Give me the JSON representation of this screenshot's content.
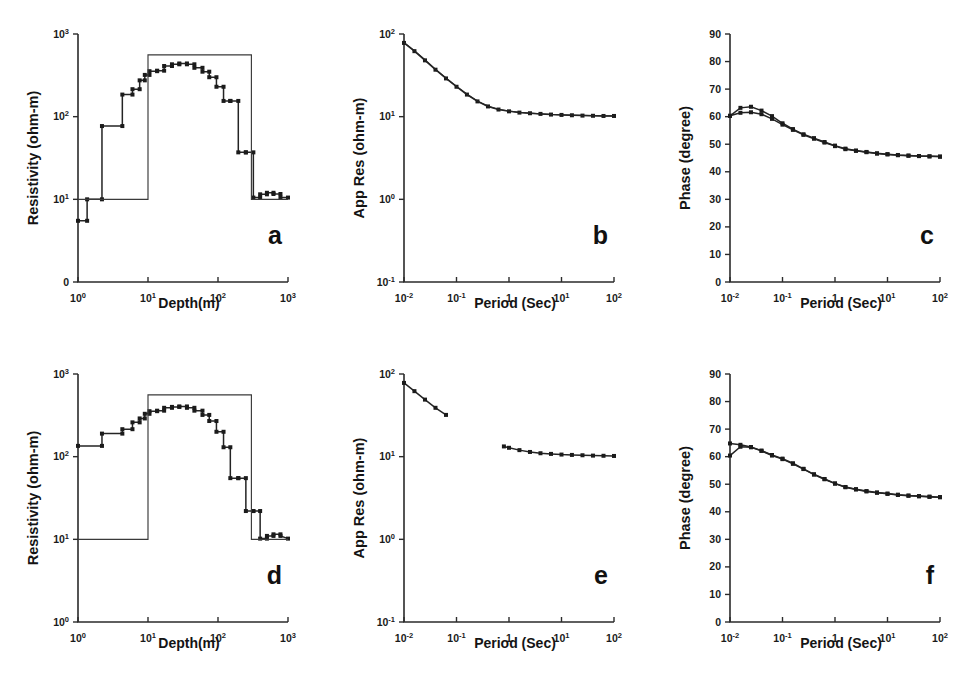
{
  "figure": {
    "background": "#ffffff",
    "ink_color": "#1a1a1a",
    "panel_count": 6
  },
  "chart_data": [
    {
      "id": "a",
      "type": "line",
      "panel_letter": "a",
      "title": "",
      "xlabel": "Depth(m)",
      "ylabel": "Resistivity (ohm-m)",
      "xscale": "log",
      "yscale": "log",
      "xlim": [
        1,
        1000
      ],
      "ylim": [
        1,
        1000
      ],
      "xticks": [
        1,
        10,
        100,
        1000
      ],
      "xticklabels": [
        "10⁰",
        "10¹",
        "10²",
        "10³"
      ],
      "yticks": [
        1,
        10,
        100,
        1000
      ],
      "yticklabels": [
        "0",
        "10¹",
        "10²",
        "10³"
      ],
      "grid": false,
      "legend": "none",
      "series": [
        {
          "name": "inverted-model-staircase",
          "style": "step-with-square-markers",
          "x": [
            1.0,
            1.35,
            1.35,
            2.2,
            2.2,
            4.3,
            4.3,
            6.0,
            6.0,
            7.6,
            7.6,
            9.0,
            9.0,
            10.5,
            10.5,
            13.5,
            13.5,
            17.0,
            17.0,
            22.0,
            22.0,
            28.0,
            28.0,
            36.0,
            36.0,
            46.0,
            46.0,
            60.0,
            60.0,
            75.0,
            75.0,
            95.0,
            95.0,
            120.0,
            120.0,
            150.0,
            150.0,
            195.0,
            195.0,
            250.0,
            250.0,
            320.0,
            320.0,
            400.0,
            400.0,
            500.0,
            500.0,
            620.0,
            620.0,
            780.0,
            780.0,
            1000.0
          ],
          "y": [
            5.5,
            5.5,
            10.0,
            10.0,
            77.0,
            77.0,
            185.0,
            185.0,
            215.0,
            215.0,
            275.0,
            275.0,
            320.0,
            320.0,
            355.0,
            355.0,
            360.0,
            360.0,
            410.0,
            410.0,
            430.0,
            430.0,
            440.0,
            440.0,
            430.0,
            430.0,
            390.0,
            390.0,
            350.0,
            350.0,
            300.0,
            300.0,
            230.0,
            230.0,
            155.0,
            155.0,
            155.0,
            155.0,
            37.0,
            37.0,
            37.0,
            37.0,
            10.5,
            10.5,
            11.5,
            11.5,
            12.0,
            12.0,
            11.6,
            11.6,
            10.5,
            10.5
          ]
        },
        {
          "name": "true-layered-model",
          "style": "block-step",
          "x": [
            1.0,
            10.0,
            10.0,
            300.0,
            300.0,
            1000.0
          ],
          "y": [
            10.0,
            10.0,
            560.0,
            560.0,
            10.0,
            10.0
          ]
        }
      ]
    },
    {
      "id": "b",
      "type": "line",
      "panel_letter": "b",
      "title": "",
      "xlabel": "Period (Sec)",
      "ylabel": "App Res (ohm-m)",
      "xscale": "log",
      "yscale": "log",
      "xlim": [
        0.01,
        100
      ],
      "ylim": [
        0.1,
        100
      ],
      "xticks": [
        0.01,
        0.1,
        1,
        10,
        100
      ],
      "xticklabels": [
        "10⁻²",
        "10⁻¹",
        "1",
        "10¹",
        "10²"
      ],
      "yticks": [
        0.1,
        1,
        10,
        100
      ],
      "yticklabels": [
        "10⁻¹",
        "10⁰",
        "10¹",
        "10²"
      ],
      "grid": false,
      "legend": "none",
      "series": [
        {
          "name": "apparent-resistivity-observed",
          "style": "line-with-square-markers",
          "x": [
            0.01,
            0.0158,
            0.0251,
            0.0398,
            0.0631,
            0.1,
            0.158,
            0.251,
            0.398,
            0.631,
            1.0,
            1.58,
            2.51,
            3.98,
            6.31,
            10.0,
            15.8,
            25.1,
            39.8,
            63.1,
            100.0
          ],
          "y": [
            78.0,
            62.0,
            48.0,
            37.0,
            29.0,
            23.0,
            18.5,
            15.3,
            13.3,
            12.2,
            11.6,
            11.2,
            11.0,
            10.8,
            10.6,
            10.5,
            10.4,
            10.3,
            10.25,
            10.2,
            10.2
          ]
        },
        {
          "name": "apparent-resistivity-calculated",
          "style": "line-overlay",
          "x": [
            0.01,
            0.0158,
            0.0251,
            0.0398,
            0.0631,
            0.1,
            0.158,
            0.251,
            0.398,
            0.631,
            1.0,
            1.58,
            2.51,
            3.98,
            6.31,
            10.0,
            15.8,
            25.1,
            39.8,
            63.1,
            100.0
          ],
          "y": [
            79.0,
            63.0,
            48.8,
            37.6,
            29.4,
            23.3,
            18.8,
            15.5,
            13.4,
            12.3,
            11.7,
            11.3,
            11.05,
            10.85,
            10.65,
            10.55,
            10.45,
            10.35,
            10.3,
            10.25,
            10.25
          ]
        }
      ]
    },
    {
      "id": "c",
      "type": "line",
      "panel_letter": "c",
      "title": "",
      "xlabel": "Period (Sec)",
      "ylabel": "Phase (degree)",
      "xscale": "log",
      "yscale": "linear",
      "xlim": [
        0.01,
        100
      ],
      "ylim": [
        0,
        90
      ],
      "xticks": [
        0.01,
        0.1,
        1,
        10,
        100
      ],
      "xticklabels": [
        "10⁻²",
        "10⁻¹",
        "1",
        "10¹",
        "10²"
      ],
      "yticks": [
        0,
        10,
        20,
        30,
        40,
        50,
        60,
        70,
        80,
        90
      ],
      "yticklabels": [
        "0",
        "10",
        "20",
        "30",
        "40",
        "50",
        "60",
        "70",
        "80",
        "90"
      ],
      "grid": false,
      "legend": "none",
      "series": [
        {
          "name": "phase-curve-upper",
          "style": "line-with-square-markers",
          "x": [
            0.01,
            0.0158,
            0.0251,
            0.0398,
            0.0631,
            0.1,
            0.158,
            0.251,
            0.398,
            0.631,
            1.0,
            1.58,
            2.51,
            3.98,
            6.31,
            10.0,
            15.8,
            25.1,
            39.8,
            63.1,
            100.0
          ],
          "y": [
            60.3,
            63.2,
            63.6,
            62.2,
            60.2,
            57.6,
            55.5,
            53.6,
            52.2,
            50.8,
            49.5,
            48.4,
            47.7,
            47.2,
            46.7,
            46.4,
            46.1,
            45.9,
            45.7,
            45.6,
            45.5
          ]
        },
        {
          "name": "phase-curve-lower",
          "style": "line-with-square-markers",
          "x": [
            0.01,
            0.0158,
            0.0251,
            0.0398,
            0.0631,
            0.1,
            0.158,
            0.251,
            0.398,
            0.631,
            1.0,
            1.58,
            2.51,
            3.98,
            6.31,
            10.0,
            15.8,
            25.1,
            39.8,
            63.1,
            100.0
          ],
          "y": [
            60.3,
            61.4,
            61.6,
            60.9,
            59.2,
            57.1,
            55.2,
            53.4,
            52.0,
            50.6,
            49.3,
            48.2,
            47.6,
            47.1,
            46.6,
            46.3,
            46.0,
            45.8,
            45.7,
            45.6,
            45.5
          ]
        }
      ]
    },
    {
      "id": "d",
      "type": "line",
      "panel_letter": "d",
      "title": "",
      "xlabel": "Depth(m)",
      "ylabel": "Resistivity (ohm-m)",
      "xscale": "log",
      "yscale": "log",
      "xlim": [
        1,
        1000
      ],
      "ylim": [
        1,
        1000
      ],
      "xticks": [
        1,
        10,
        100,
        1000
      ],
      "xticklabels": [
        "10⁰",
        "10¹",
        "10²",
        "10³"
      ],
      "yticks": [
        1,
        10,
        100,
        1000
      ],
      "yticklabels": [
        "10⁰",
        "10¹",
        "10²",
        "10³"
      ],
      "grid": false,
      "legend": "none",
      "series": [
        {
          "name": "inverted-model-staircase",
          "style": "step-with-square-markers",
          "x": [
            1.0,
            2.2,
            2.2,
            4.3,
            4.3,
            6.0,
            6.0,
            7.6,
            7.6,
            9.0,
            9.0,
            10.5,
            10.5,
            13.5,
            13.5,
            17.0,
            17.0,
            22.0,
            22.0,
            28.0,
            28.0,
            36.0,
            36.0,
            46.0,
            46.0,
            60.0,
            60.0,
            75.0,
            75.0,
            95.0,
            95.0,
            120.0,
            120.0,
            150.0,
            150.0,
            195.0,
            195.0,
            250.0,
            250.0,
            320.0,
            320.0,
            400.0,
            400.0,
            500.0,
            500.0,
            620.0,
            620.0,
            780.0,
            780.0,
            1000.0
          ],
          "y": [
            135.0,
            135.0,
            190.0,
            190.0,
            215.0,
            215.0,
            260.0,
            260.0,
            290.0,
            290.0,
            330.0,
            330.0,
            355.0,
            355.0,
            360.0,
            360.0,
            390.0,
            390.0,
            400.0,
            400.0,
            405.0,
            405.0,
            390.0,
            390.0,
            360.0,
            360.0,
            320.0,
            320.0,
            270.0,
            270.0,
            200.0,
            200.0,
            130.0,
            130.0,
            55.0,
            55.0,
            55.0,
            55.0,
            22.0,
            22.0,
            22.0,
            22.0,
            10.2,
            10.2,
            11.0,
            11.0,
            11.5,
            11.5,
            11.0,
            10.2
          ]
        },
        {
          "name": "true-layered-model",
          "style": "block-step",
          "x": [
            1.0,
            10.0,
            10.0,
            300.0,
            300.0,
            1000.0
          ],
          "y": [
            10.0,
            10.0,
            560.0,
            560.0,
            10.0,
            10.0
          ]
        }
      ]
    },
    {
      "id": "e",
      "type": "line",
      "panel_letter": "e",
      "title": "",
      "xlabel": "Period (Sec)",
      "ylabel": "App Res (ohm-m)",
      "xscale": "log",
      "yscale": "log",
      "xlim": [
        0.01,
        100
      ],
      "ylim": [
        0.1,
        100
      ],
      "xticks": [
        0.01,
        0.1,
        1,
        10,
        100
      ],
      "xticklabels": [
        "10⁻²",
        "10⁻¹",
        "1",
        "10¹",
        "10²"
      ],
      "yticks": [
        0.1,
        1,
        10,
        100
      ],
      "yticklabels": [
        "10⁻¹",
        "10⁰",
        "10¹",
        "10²"
      ],
      "grid": false,
      "legend": "none",
      "note": "curve is broken: short-period branch ends near 0.06 s, long-period branch resumes near 0.8 s",
      "series": [
        {
          "name": "app-res-short-period-branch",
          "style": "line-with-square-markers",
          "x": [
            0.01,
            0.0158,
            0.0251,
            0.0398,
            0.0631
          ],
          "y": [
            78.0,
            62.0,
            49.0,
            39.0,
            32.0
          ]
        },
        {
          "name": "app-res-long-period-branch",
          "style": "line-with-square-markers",
          "x": [
            0.8,
            1.0,
            1.58,
            2.51,
            3.98,
            6.31,
            10.0,
            15.8,
            25.1,
            39.8,
            63.1,
            100.0
          ],
          "y": [
            13.3,
            12.8,
            12.0,
            11.4,
            11.0,
            10.8,
            10.6,
            10.5,
            10.4,
            10.3,
            10.25,
            10.2
          ]
        }
      ]
    },
    {
      "id": "f",
      "type": "line",
      "panel_letter": "f",
      "title": "",
      "xlabel": "Period (Sec)",
      "ylabel": "Phase (degree)",
      "xscale": "log",
      "yscale": "linear",
      "xlim": [
        0.01,
        100
      ],
      "ylim": [
        0,
        90
      ],
      "xticks": [
        0.01,
        0.1,
        1,
        10,
        100
      ],
      "xticklabels": [
        "10⁻²",
        "10⁻¹",
        "1",
        "10¹",
        "10²"
      ],
      "yticks": [
        0,
        10,
        20,
        30,
        40,
        50,
        60,
        70,
        80,
        90
      ],
      "yticklabels": [
        "0",
        "10",
        "20",
        "30",
        "40",
        "50",
        "60",
        "70",
        "80",
        "90"
      ],
      "grid": false,
      "legend": "none",
      "series": [
        {
          "name": "phase-curve-upper",
          "style": "line-with-square-markers",
          "x": [
            0.01,
            0.0158,
            0.0251,
            0.0398,
            0.0631,
            0.1,
            0.158,
            0.251,
            0.398,
            0.631,
            1.0,
            1.58,
            2.51,
            3.98,
            6.31,
            10.0,
            15.8,
            25.1,
            39.8,
            63.1,
            100.0
          ],
          "y": [
            64.8,
            64.3,
            63.5,
            62.2,
            60.6,
            59.3,
            57.6,
            55.6,
            53.6,
            51.9,
            50.3,
            49.0,
            48.2,
            47.5,
            47.0,
            46.6,
            46.2,
            45.9,
            45.7,
            45.5,
            45.3
          ]
        },
        {
          "name": "phase-curve-lower",
          "style": "line-with-square-markers",
          "x": [
            0.01,
            0.0158,
            0.0251,
            0.0398,
            0.0631,
            0.1,
            0.158,
            0.251,
            0.398,
            0.631,
            1.0,
            1.58,
            2.51,
            3.98,
            6.31,
            10.0,
            15.8,
            25.1,
            39.8,
            63.1,
            100.0
          ],
          "y": [
            60.4,
            63.6,
            63.4,
            62.1,
            60.4,
            59.1,
            57.4,
            55.5,
            53.5,
            51.8,
            50.2,
            48.9,
            48.1,
            47.4,
            46.9,
            46.5,
            46.1,
            45.8,
            45.6,
            45.4,
            45.3
          ]
        }
      ]
    }
  ]
}
